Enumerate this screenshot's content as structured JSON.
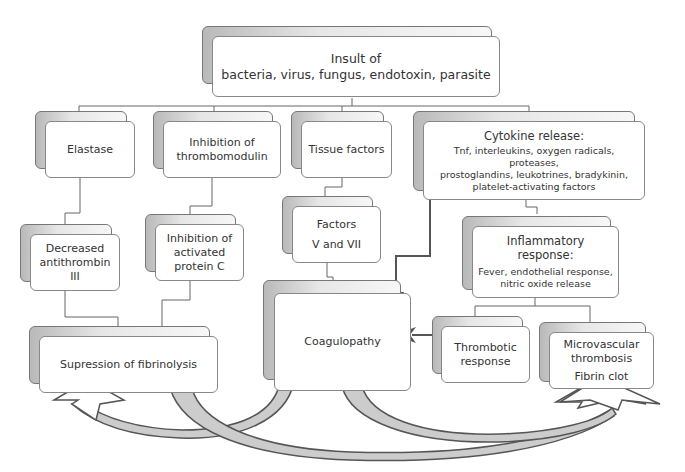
{
  "diagram": {
    "root": {
      "line1": "Insult of",
      "line2": "bacteria, virus, fungus, endotoxin, parasite"
    },
    "elastase": {
      "label": "Elastase"
    },
    "inhibition_thrombomodulin": {
      "line1": "Inhibition of",
      "line2": "thrombomodulin"
    },
    "tissue_factors": {
      "label": "Tissue factors"
    },
    "cytokine_release": {
      "title": "Cytokine release:",
      "line1": "Tnf, interleukins, oxygen radicals, proteases,",
      "line2": "prostoglandins, leukotrines, bradykinin,",
      "line3": "platelet-activating factors"
    },
    "decreased_antithrombin": {
      "line1": "Decreased",
      "line2": "antithrombin",
      "line3": "III"
    },
    "inhibition_protein_c": {
      "line1": "Inhibition of",
      "line2": "activated",
      "line3": "protein C"
    },
    "factors_v_vii": {
      "line1": "Factors",
      "line2": "V  and  VII"
    },
    "inflammatory_response": {
      "title": "Inflammatory response:",
      "line1": "Fever, endothelial response,",
      "line2": "nitric oxide release"
    },
    "supression_fibrinolysis": {
      "label": "Supression of fibrinolysis"
    },
    "coagulopathy": {
      "label": "Coagulopathy"
    },
    "thrombotic_response": {
      "line1": "Thrombotic",
      "line2": "response"
    },
    "microvascular_thrombosis": {
      "line1": "Microvascular",
      "line2": "thrombosis",
      "line3": "Fibrin clot"
    }
  },
  "colors": {
    "box_border": "#888888",
    "connector": "#666666",
    "arrow": "#555555",
    "curved_arrow_fill": "#cccccc",
    "curved_arrow_stroke": "#555555"
  }
}
